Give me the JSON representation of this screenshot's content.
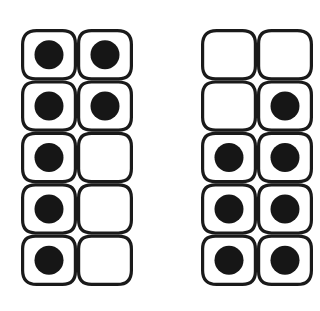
{
  "canvas": {
    "width": 320,
    "height": 311,
    "background_color": "#ffffff"
  },
  "style": {
    "stroke_color": "#1a1a1a",
    "dot_color": "#161616",
    "cell_fill_color": "#ffffff",
    "stroke_width": 3.2,
    "corner_radius": 14,
    "dot_radius": 14.5
  },
  "diagram": {
    "type": "dot-frame-pair",
    "rows": 5,
    "columns": 2,
    "panel_count": 2,
    "panels": [
      {
        "name": "left-panel",
        "x": 21,
        "y": 29,
        "width": 112,
        "height": 257,
        "filled_count": 7,
        "empty_count": 3,
        "cells": [
          {
            "row": 1,
            "col": 1,
            "filled": true
          },
          {
            "row": 1,
            "col": 2,
            "filled": true
          },
          {
            "row": 2,
            "col": 1,
            "filled": true
          },
          {
            "row": 2,
            "col": 2,
            "filled": true
          },
          {
            "row": 3,
            "col": 1,
            "filled": true
          },
          {
            "row": 3,
            "col": 2,
            "filled": false
          },
          {
            "row": 4,
            "col": 1,
            "filled": true
          },
          {
            "row": 4,
            "col": 2,
            "filled": false
          },
          {
            "row": 5,
            "col": 1,
            "filled": true
          },
          {
            "row": 5,
            "col": 2,
            "filled": false
          }
        ]
      },
      {
        "name": "right-panel",
        "x": 201,
        "y": 29,
        "width": 112,
        "height": 257,
        "filled_count": 7,
        "empty_count": 3,
        "cells": [
          {
            "row": 1,
            "col": 1,
            "filled": false
          },
          {
            "row": 1,
            "col": 2,
            "filled": false
          },
          {
            "row": 2,
            "col": 1,
            "filled": false
          },
          {
            "row": 2,
            "col": 2,
            "filled": true
          },
          {
            "row": 3,
            "col": 1,
            "filled": true
          },
          {
            "row": 3,
            "col": 2,
            "filled": true
          },
          {
            "row": 4,
            "col": 1,
            "filled": true
          },
          {
            "row": 4,
            "col": 2,
            "filled": true
          },
          {
            "row": 5,
            "col": 1,
            "filled": true
          },
          {
            "row": 5,
            "col": 2,
            "filled": true
          }
        ]
      }
    ]
  }
}
